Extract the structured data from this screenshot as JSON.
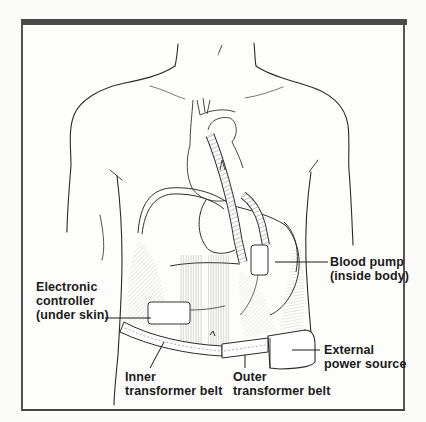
{
  "figure": {
    "frame_color": "#4a4a4a",
    "line_color": "#2a2a2a"
  },
  "labels": {
    "electronic_controller": {
      "line1": "Electronic",
      "line2": "controller",
      "line3": "(under skin)"
    },
    "blood_pump": {
      "line1": "Blood pump",
      "line2": "(inside body)"
    },
    "external_power": {
      "line1": "External",
      "line2": "power source"
    },
    "inner_belt": {
      "line1": "Inner",
      "line2": "transformer belt"
    },
    "outer_belt": {
      "line1": "Outer",
      "line2": "transformer belt"
    }
  }
}
